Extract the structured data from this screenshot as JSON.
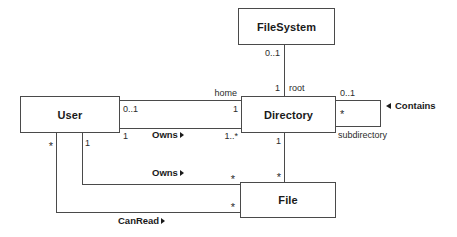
{
  "diagram": {
    "kind": "uml-class-diagram",
    "colors": {
      "line": "#4a4a4a",
      "text": "#1a1a1a",
      "background": "#ffffff"
    },
    "classes": [
      {
        "id": "filesystem",
        "name": "FileSystem"
      },
      {
        "id": "user",
        "name": "User"
      },
      {
        "id": "directory",
        "name": "Directory"
      },
      {
        "id": "file",
        "name": "File"
      }
    ],
    "associations": [
      {
        "id": "fs-root-dir",
        "label": "",
        "source": "FileSystem",
        "target": "Directory",
        "source_multiplicity": "0..1",
        "target_multiplicity": "1",
        "target_role": "root"
      },
      {
        "id": "user-home-dir",
        "label": "",
        "source": "User",
        "target": "Directory",
        "source_multiplicity": "0..1",
        "target_multiplicity": "1",
        "target_role": "home"
      },
      {
        "id": "user-owns-dir",
        "label": "Owns",
        "source": "User",
        "target": "Directory",
        "source_multiplicity": "1",
        "target_multiplicity": "1..*"
      },
      {
        "id": "dir-contains-file",
        "label": "",
        "source": "Directory",
        "target": "File",
        "source_multiplicity": "1",
        "target_multiplicity": "*"
      },
      {
        "id": "dir-contains-subdir",
        "label": "Contains",
        "source": "Directory",
        "target": "Directory",
        "source_multiplicity": "0..1",
        "target_multiplicity": "*",
        "target_role": "subdirectory"
      },
      {
        "id": "user-owns-file",
        "label": "Owns",
        "source": "User",
        "target": "File",
        "source_multiplicity": "1",
        "target_multiplicity": "*"
      },
      {
        "id": "user-canread-file",
        "label": "CanRead",
        "source": "User",
        "target": "File",
        "source_multiplicity": "*",
        "target_multiplicity": "*"
      }
    ],
    "labels": {
      "filesystem_name": "FileSystem",
      "user_name": "User",
      "directory_name": "Directory",
      "file_name": "File",
      "fs_bottom_mult": "0..1",
      "dir_top_mult": "1",
      "dir_root_role": "root",
      "home_role": "home",
      "user_home_mult": "0..1",
      "dir_home_mult": "1",
      "user_owns_dir_mult": "1",
      "owns_dir_label": "Owns",
      "dir_owns_mult": "1..*",
      "contains_upper_mult": "0..1",
      "contains_lower_mult": "*",
      "subdirectory_role": "subdirectory",
      "contains_label": "Contains",
      "dir_file_top_mult": "1",
      "dir_file_bottom_mult": "*",
      "user_star_mult": "*",
      "user_one_mult": "1",
      "owns_file_label": "Owns",
      "file_owns_mult": "*",
      "canread_label": "CanRead",
      "file_canread_mult": "*"
    }
  }
}
